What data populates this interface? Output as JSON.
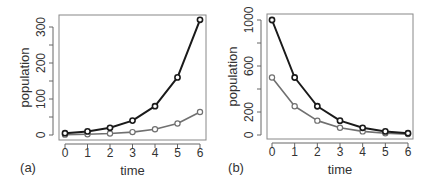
{
  "chart_data": [
    {
      "type": "line",
      "panel_label": "(a)",
      "title": "",
      "xlabel": "time",
      "ylabel": "population",
      "x": [
        0,
        1,
        2,
        3,
        4,
        5,
        6
      ],
      "x_ticks": [
        0,
        1,
        2,
        3,
        4,
        5,
        6
      ],
      "y_ticks": [
        0,
        50,
        100,
        150,
        200,
        250,
        300
      ],
      "y_tick_labels": [
        "0",
        "",
        "100",
        "",
        "200",
        "",
        "300"
      ],
      "ylim": [
        0,
        320
      ],
      "grid": false,
      "series": [
        {
          "name": "dark",
          "color": "#1a1a1a",
          "values": [
            5,
            10,
            20,
            40,
            80,
            160,
            320
          ]
        },
        {
          "name": "light",
          "color": "#707070",
          "values": [
            1,
            2,
            4,
            8,
            16,
            32,
            64
          ]
        }
      ]
    },
    {
      "type": "line",
      "panel_label": "(b)",
      "title": "",
      "xlabel": "time",
      "ylabel": "population",
      "x": [
        0,
        1,
        2,
        3,
        4,
        5,
        6
      ],
      "x_ticks": [
        0,
        1,
        2,
        3,
        4,
        5,
        6
      ],
      "y_ticks": [
        0,
        200,
        400,
        600,
        800,
        1000
      ],
      "y_tick_labels": [
        "0",
        "200",
        "",
        "600",
        "",
        "1000"
      ],
      "ylim": [
        0,
        1000
      ],
      "grid": false,
      "series": [
        {
          "name": "dark",
          "color": "#1a1a1a",
          "values": [
            1000,
            500,
            250,
            125,
            62.5,
            31.25,
            15.6
          ]
        },
        {
          "name": "light",
          "color": "#707070",
          "values": [
            500,
            250,
            125,
            62.5,
            31.25,
            15.6,
            7.8
          ]
        }
      ]
    }
  ],
  "layout": [
    {
      "box": [
        59,
        15,
        206,
        140
      ],
      "x0px": 65,
      "x6px": 200,
      "y0px": 135,
      "ymaxval": 300,
      "ymaxpx": 27,
      "label_pos": [
        28,
        172
      ]
    },
    {
      "box": [
        267,
        14,
        413,
        139
      ],
      "x0px": 272,
      "x6px": 408,
      "y0px": 135,
      "ymaxval": 1000,
      "ymaxpx": 20,
      "label_pos": [
        236,
        172
      ]
    }
  ]
}
